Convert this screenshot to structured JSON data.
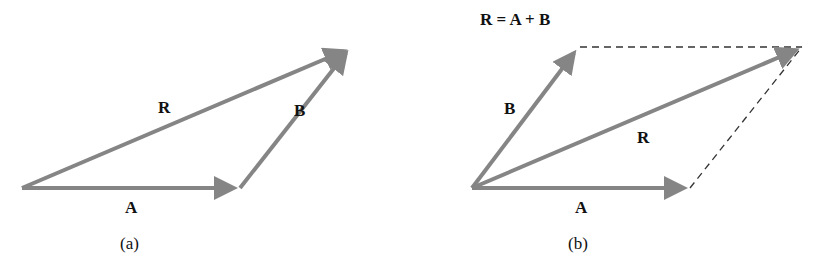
{
  "figure": {
    "panel_a": {
      "caption": "(a)",
      "labels": {
        "A": "A",
        "B": "B",
        "R": "R"
      },
      "vectors": {
        "A": {
          "from": [
            22,
            188
          ],
          "to": [
            240,
            188
          ]
        },
        "B": {
          "from": [
            240,
            188
          ],
          "to": [
            350,
            48
          ]
        },
        "R": {
          "from": [
            22,
            188
          ],
          "to": [
            350,
            48
          ]
        }
      }
    },
    "panel_b": {
      "caption": "(b)",
      "equation": "R = A + B",
      "labels": {
        "A": "A",
        "B": "B",
        "R": "R"
      },
      "vectors": {
        "A": {
          "from": [
            472,
            188
          ],
          "to": [
            690,
            188
          ]
        },
        "B": {
          "from": [
            472,
            188
          ],
          "to": [
            578,
            47
          ]
        },
        "R": {
          "from": [
            472,
            188
          ],
          "to": [
            802,
            47
          ]
        }
      }
    },
    "colors": {
      "arrow": "#858585",
      "text": "#111111",
      "dashed": "#333333"
    }
  }
}
